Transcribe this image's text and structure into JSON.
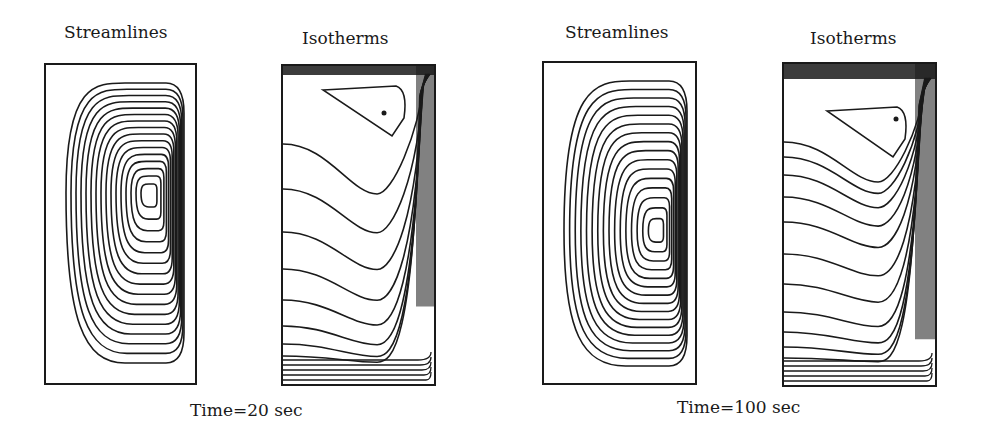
{
  "figure": {
    "groups": [
      {
        "caption": "Time=20 sec",
        "panels": [
          {
            "title": "Streamlines",
            "kind": "streamlines"
          },
          {
            "title": "Isotherms",
            "kind": "isotherms"
          }
        ]
      },
      {
        "caption": "Time=100 sec",
        "panels": [
          {
            "title": "Streamlines",
            "kind": "streamlines"
          },
          {
            "title": "Isotherms",
            "kind": "isotherms"
          }
        ]
      }
    ]
  },
  "colors": {
    "line": "#1a1a1a",
    "background": "#ffffff"
  }
}
